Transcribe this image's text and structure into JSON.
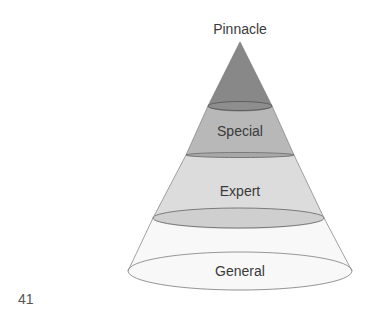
{
  "diagram": {
    "title_label": "Pinnacle",
    "layers": [
      {
        "name": "Pinnacle",
        "label": "",
        "color": "#8a8a8a"
      },
      {
        "name": "Special",
        "label": "Special",
        "color": "#b3b3b3"
      },
      {
        "name": "Expert",
        "label": "Expert",
        "color": "#d9d9d9"
      },
      {
        "name": "General",
        "label": "General",
        "color": "#f8f8f8"
      }
    ],
    "outline_color": "#777777"
  },
  "page_number": "41"
}
